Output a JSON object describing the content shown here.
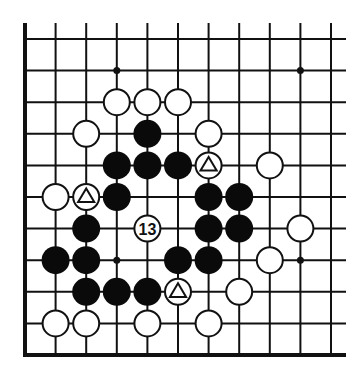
{
  "diagram": {
    "type": "go-board-fragment",
    "colors": {
      "background": "#ffffff",
      "line": "#111111",
      "black_stone": "#0a0a0a",
      "white_stone_fill": "#ffffff",
      "white_stone_stroke": "#111111"
    },
    "grid": {
      "columns": 11,
      "rows": 11,
      "x0": 25,
      "dx": 30.6,
      "y0": 39,
      "dy": 31.6,
      "stone_radius": 14,
      "open_right_extend": 15,
      "open_top_extend": 16,
      "thick_edges": [
        "left",
        "bottom"
      ]
    },
    "star_points": [
      {
        "col": 3,
        "row": 1
      },
      {
        "col": 9,
        "row": 1
      },
      {
        "col": 3,
        "row": 7
      },
      {
        "col": 9,
        "row": 7
      }
    ],
    "stones": [
      {
        "col": 3,
        "row": 2,
        "color": "white"
      },
      {
        "col": 4,
        "row": 2,
        "color": "white"
      },
      {
        "col": 5,
        "row": 2,
        "color": "white"
      },
      {
        "col": 2,
        "row": 3,
        "color": "white"
      },
      {
        "col": 4,
        "row": 3,
        "color": "black"
      },
      {
        "col": 6,
        "row": 3,
        "color": "white"
      },
      {
        "col": 3,
        "row": 4,
        "color": "black"
      },
      {
        "col": 4,
        "row": 4,
        "color": "black"
      },
      {
        "col": 5,
        "row": 4,
        "color": "black"
      },
      {
        "col": 6,
        "row": 4,
        "color": "white",
        "mark": "triangle"
      },
      {
        "col": 8,
        "row": 4,
        "color": "white"
      },
      {
        "col": 1,
        "row": 5,
        "color": "white"
      },
      {
        "col": 2,
        "row": 5,
        "color": "white",
        "mark": "triangle"
      },
      {
        "col": 3,
        "row": 5,
        "color": "black"
      },
      {
        "col": 6,
        "row": 5,
        "color": "black"
      },
      {
        "col": 7,
        "row": 5,
        "color": "black"
      },
      {
        "col": 2,
        "row": 6,
        "color": "black"
      },
      {
        "col": 4,
        "row": 6,
        "color": "white",
        "label": "13"
      },
      {
        "col": 6,
        "row": 6,
        "color": "black"
      },
      {
        "col": 7,
        "row": 6,
        "color": "black"
      },
      {
        "col": 9,
        "row": 6,
        "color": "white"
      },
      {
        "col": 1,
        "row": 7,
        "color": "black"
      },
      {
        "col": 2,
        "row": 7,
        "color": "black"
      },
      {
        "col": 5,
        "row": 7,
        "color": "black"
      },
      {
        "col": 6,
        "row": 7,
        "color": "black"
      },
      {
        "col": 8,
        "row": 7,
        "color": "white"
      },
      {
        "col": 2,
        "row": 8,
        "color": "black"
      },
      {
        "col": 3,
        "row": 8,
        "color": "black"
      },
      {
        "col": 4,
        "row": 8,
        "color": "black"
      },
      {
        "col": 5,
        "row": 8,
        "color": "white",
        "mark": "triangle"
      },
      {
        "col": 7,
        "row": 8,
        "color": "white"
      },
      {
        "col": 1,
        "row": 9,
        "color": "white"
      },
      {
        "col": 2,
        "row": 9,
        "color": "white"
      },
      {
        "col": 4,
        "row": 9,
        "color": "white"
      },
      {
        "col": 6,
        "row": 9,
        "color": "white"
      }
    ],
    "move_label": "13"
  }
}
